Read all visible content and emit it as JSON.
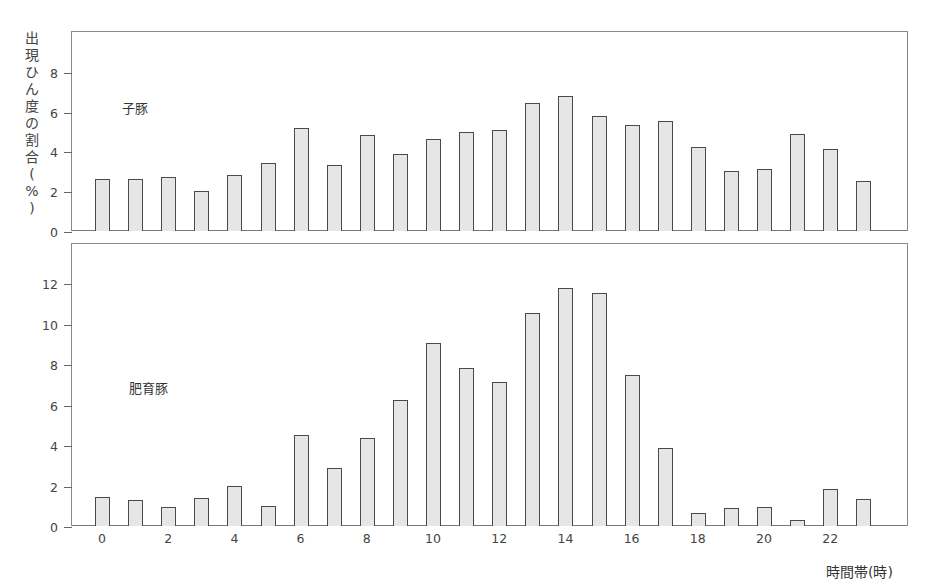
{
  "chart_data": [
    {
      "type": "bar",
      "title": "子豚",
      "xlabel": "時間帯(時)",
      "ylabel": "出現ひん度の割合(%)",
      "categories": [
        0,
        1,
        2,
        3,
        4,
        5,
        6,
        7,
        8,
        9,
        10,
        11,
        12,
        13,
        14,
        15,
        16,
        17,
        18,
        19,
        20,
        21,
        22,
        23
      ],
      "values": [
        2.6,
        2.6,
        2.7,
        2.0,
        2.8,
        3.4,
        5.2,
        3.3,
        4.8,
        3.85,
        4.6,
        5.0,
        5.1,
        6.45,
        6.8,
        5.8,
        5.35,
        5.55,
        4.2,
        3.0,
        3.1,
        4.9,
        4.1,
        2.5
      ],
      "yticks": [
        0,
        2,
        4,
        6,
        8
      ],
      "ylim": [
        0,
        10
      ],
      "grid": false
    },
    {
      "type": "bar",
      "title": "肥育豚",
      "xlabel": "時間帯(時)",
      "ylabel": "出現ひん度の割合(%)",
      "categories": [
        0,
        1,
        2,
        3,
        4,
        5,
        6,
        7,
        8,
        9,
        10,
        11,
        12,
        13,
        14,
        15,
        16,
        17,
        18,
        19,
        20,
        21,
        22,
        23
      ],
      "values": [
        1.45,
        1.3,
        0.95,
        1.4,
        2.0,
        1.0,
        4.5,
        2.85,
        4.35,
        6.2,
        9.05,
        7.8,
        7.1,
        10.5,
        11.75,
        11.5,
        7.45,
        3.85,
        0.65,
        0.9,
        0.95,
        0.3,
        1.85,
        1.35
      ],
      "yticks": [
        0,
        2,
        4,
        6,
        8,
        10,
        12
      ],
      "xticks": [
        0,
        2,
        4,
        6,
        8,
        10,
        12,
        14,
        16,
        18,
        20,
        22
      ],
      "ylim": [
        0,
        14
      ],
      "grid": false
    }
  ],
  "labels": {
    "ylabel_chars": [
      "出",
      "現",
      "ひ",
      "ん",
      "度",
      "の",
      "割",
      "合",
      "(",
      "%",
      ")"
    ],
    "top_series": "子豚",
    "bottom_series": "肥育豚",
    "xlabel": "時間帯(時)",
    "top_yticks": [
      "0",
      "2",
      "4",
      "6",
      "8"
    ],
    "bottom_yticks": [
      "0",
      "2",
      "4",
      "6",
      "8",
      "10",
      "12"
    ],
    "xticks": [
      "0",
      "2",
      "4",
      "6",
      "8",
      "10",
      "12",
      "14",
      "16",
      "18",
      "20",
      "22"
    ]
  }
}
